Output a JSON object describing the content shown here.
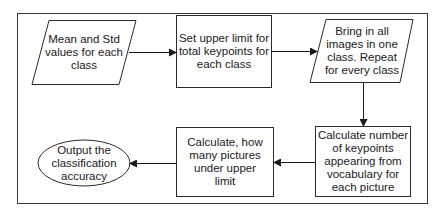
{
  "diagram": {
    "type": "flowchart",
    "colors": {
      "stroke": "#2a2a2a",
      "background": "#ffffff",
      "text": "#1a1a1a"
    },
    "nodes": [
      {
        "id": "mean_std",
        "shape": "parallelogram",
        "text": "Mean and Std values for each class"
      },
      {
        "id": "upper_limit",
        "shape": "rectangle",
        "text": "Set upper limit for total keypoints for each class"
      },
      {
        "id": "bring_images",
        "shape": "parallelogram",
        "text": "Bring in all images in one class. Repeat for every class"
      },
      {
        "id": "calc_keypoints",
        "shape": "rectangle",
        "text": "Calculate number of keypoints appearing from vocabulary for each picture"
      },
      {
        "id": "calc_under",
        "shape": "rectangle",
        "text": "Calculate, how many pictures under upper limit"
      },
      {
        "id": "output",
        "shape": "ellipse",
        "text": "Output the classification accuracy"
      }
    ],
    "edges": [
      {
        "from": "mean_std",
        "to": "upper_limit"
      },
      {
        "from": "upper_limit",
        "to": "bring_images"
      },
      {
        "from": "bring_images",
        "to": "calc_keypoints"
      },
      {
        "from": "calc_keypoints",
        "to": "calc_under"
      },
      {
        "from": "calc_under",
        "to": "output"
      }
    ]
  }
}
